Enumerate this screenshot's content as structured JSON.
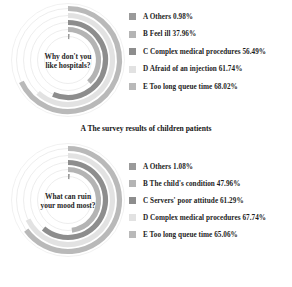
{
  "chart_data": [
    {
      "type": "bar",
      "subtype": "radial-bar",
      "title": "Why don't you like hospitals?",
      "caption": "A The survey results of children patients",
      "xlabel": "",
      "ylabel": "",
      "ylim": [
        0,
        100
      ],
      "units": "%",
      "grid": true,
      "legend_position": "right",
      "categories": [
        "A Others",
        "B Feel ill",
        "C Complex medical procedures",
        "D Afraid of an injection",
        "E Too long queue time"
      ],
      "values": [
        0.98,
        37.96,
        56.49,
        61.74,
        68.02
      ],
      "value_labels": [
        "0.98%",
        "37.96%",
        "56.49%",
        "61.74%",
        "68.02%"
      ],
      "colors": [
        "#9a9a9a",
        "#b4b4b4",
        "#8d8d8d",
        "#e2e2e2",
        "#b9b9b9"
      ],
      "legend": [
        {
          "key": "A",
          "label": "A Others",
          "value": "0.98%",
          "color": "#9a9a9a"
        },
        {
          "key": "B",
          "label": "B Feel ill",
          "value": "37.96%",
          "color": "#b4b4b4"
        },
        {
          "key": "C",
          "label": "C Complex medical procedures",
          "value": "56.49%",
          "color": "#8d8d8d"
        },
        {
          "key": "D",
          "label": "D Afraid of an injection",
          "value": "61.74%",
          "color": "#e2e2e2"
        },
        {
          "key": "E",
          "label": "E Too long queue time",
          "value": "68.02%",
          "color": "#b9b9b9"
        }
      ]
    },
    {
      "type": "bar",
      "subtype": "radial-bar",
      "title": "What can ruin your mood most?",
      "caption": "",
      "xlabel": "",
      "ylabel": "",
      "ylim": [
        0,
        100
      ],
      "units": "%",
      "grid": true,
      "legend_position": "right",
      "categories": [
        "A Others",
        "B The child's condition",
        "C Servers' poor attitude",
        "D Complex medical procedures",
        "E Too long queue time"
      ],
      "values": [
        1.08,
        47.96,
        61.29,
        67.74,
        65.06
      ],
      "value_labels": [
        "1.08%",
        "47.96%",
        "61.29%",
        "67.74%",
        "65.06%"
      ],
      "colors": [
        "#9a9a9a",
        "#b4b4b4",
        "#8d8d8d",
        "#e2e2e2",
        "#b9b9b9"
      ],
      "legend": [
        {
          "key": "A",
          "label": "A Others",
          "value": "1.08%",
          "color": "#9a9a9a"
        },
        {
          "key": "B",
          "label": "B The child's condition",
          "value": "47.96%",
          "color": "#b4b4b4"
        },
        {
          "key": "C",
          "label": "C Servers' poor attitude",
          "value": "61.29%",
          "color": "#8d8d8d"
        },
        {
          "key": "D",
          "label": "D Complex medical procedures",
          "value": "67.74%",
          "color": "#e2e2e2"
        },
        {
          "key": "E",
          "label": "E Too long queue time",
          "value": "65.06%",
          "color": "#b9b9b9"
        }
      ]
    }
  ],
  "top": {
    "center_title": "Why don't you like hospitals?",
    "caption": "A The survey results of children patients",
    "legend": [
      {
        "text": "A Others  0.98%",
        "color": "#9a9a9a"
      },
      {
        "text": "B Feel ill  37.96%",
        "color": "#b4b4b4"
      },
      {
        "text": "C Complex medical procedures  56.49%",
        "color": "#8d8d8d"
      },
      {
        "text": "D Afraid of an injection  61.74%",
        "color": "#e2e2e2"
      },
      {
        "text": "E Too long queue time  68.02%",
        "color": "#b9b9b9"
      }
    ]
  },
  "bottom": {
    "center_title": "What can ruin your mood most?",
    "caption": "",
    "legend": [
      {
        "text": "A Others  1.08%",
        "color": "#9a9a9a"
      },
      {
        "text": "B The child's condition  47.96%",
        "color": "#b4b4b4"
      },
      {
        "text": "C Servers' poor attitude  61.29%",
        "color": "#8d8d8d"
      },
      {
        "text": "D Complex medical procedures  67.74%",
        "color": "#e2e2e2"
      },
      {
        "text": "E Too long queue time  65.06%",
        "color": "#b9b9b9"
      }
    ]
  }
}
